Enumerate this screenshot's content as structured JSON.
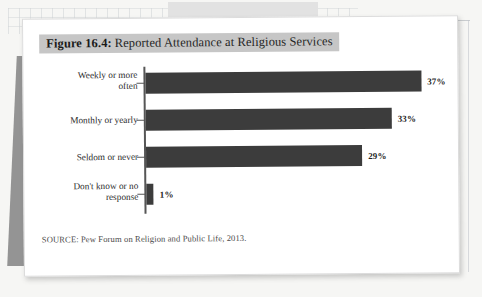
{
  "figure": {
    "title_prefix": "Figure 16.4:",
    "title_rest": "Reported Attendance at Religious Services",
    "source": "SOURCE: Pew Forum on Religion and Public Life, 2013.",
    "band_color": "#c6c6c6",
    "bar_color": "#3c3c3c",
    "axis_color": "#565656"
  },
  "chart_data": {
    "type": "bar",
    "orientation": "horizontal",
    "title": "Figure 16.4: Reported Attendance at Religious Services",
    "xlabel": "",
    "ylabel": "",
    "xlim": [
      0,
      40
    ],
    "grid": false,
    "legend": false,
    "source": "SOURCE: Pew Forum on Religion and Public Life, 2013.",
    "categories": [
      "Weekly or more often",
      "Monthly or yearly",
      "Seldom or never",
      "Don't know or no response"
    ],
    "category_lines": [
      [
        "Weekly or more",
        "often"
      ],
      [
        "Monthly or yearly"
      ],
      [
        "Seldom or never"
      ],
      [
        "Don't know or no",
        "response"
      ]
    ],
    "values": [
      37,
      33,
      29,
      1
    ],
    "value_labels": [
      "37%",
      "33%",
      "29%",
      "1%"
    ],
    "units": "percent"
  }
}
